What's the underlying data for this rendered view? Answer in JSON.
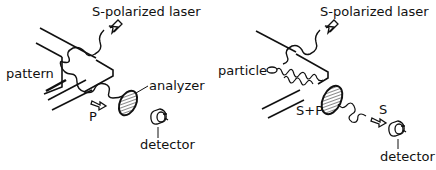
{
  "left_panel": {
    "laser_label": "S-polarized laser",
    "pattern_label": "pattern",
    "analyzer_label": "analyzer",
    "output_label": "P",
    "detector_label": "detector"
  },
  "right_panel": {
    "laser_label": "S-polarized laser",
    "particle_label": "particle",
    "mixed_label": "S+P",
    "output_label": "S",
    "detector_label": "detector"
  },
  "colors": {
    "ink": "#111111",
    "background": "#ffffff"
  }
}
